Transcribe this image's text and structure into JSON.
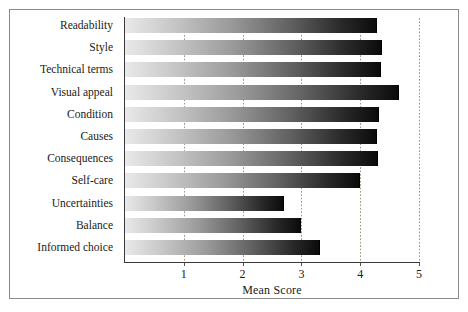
{
  "chart_data": {
    "type": "bar",
    "orientation": "horizontal",
    "title": "",
    "subtitle": "",
    "xlabel": "Mean Score",
    "ylabel": "",
    "xlim": [
      0,
      5.2
    ],
    "xticks": [
      1,
      2,
      3,
      4,
      5
    ],
    "xticklabels": [
      "1",
      "2",
      "3",
      "4",
      "5"
    ],
    "grid": "vertical-dotted",
    "legend": "none",
    "bar_style": "grayscale-gradient-light-to-dark",
    "categories": [
      "Readability",
      "Style",
      "Technical terms",
      "Visual appeal",
      "Condition",
      "Causes",
      "Consequences",
      "Self-care",
      "Uncertainties",
      "Balance",
      "Informed choice"
    ],
    "values": [
      4.28,
      4.37,
      4.35,
      4.66,
      4.32,
      4.28,
      4.3,
      4.0,
      2.7,
      3.0,
      3.32
    ],
    "series": [
      {
        "name": "Mean Score",
        "values": [
          4.28,
          4.37,
          4.35,
          4.66,
          4.32,
          4.28,
          4.3,
          4.0,
          2.7,
          3.0,
          3.32
        ]
      }
    ]
  },
  "colors": {
    "frame": "#8a8a8a",
    "axis": "#3a3a3a",
    "gridline": "#9a9a86",
    "text": "#1a1a1a",
    "bar_start": "#e9e9e9",
    "bar_end": "#0b0b0b",
    "background": "#ffffff"
  }
}
